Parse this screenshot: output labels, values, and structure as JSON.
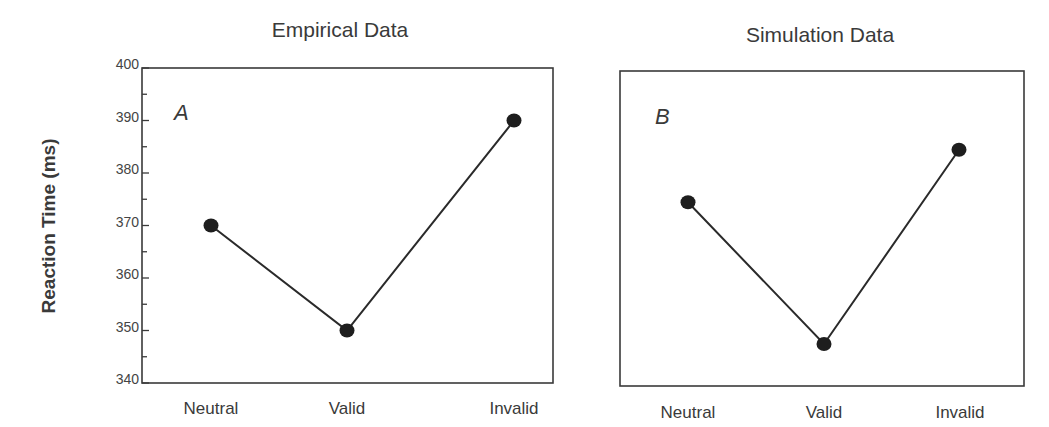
{
  "chart_data": [
    {
      "type": "line",
      "title": "Empirical Data",
      "panel_label": "A",
      "xlabel": "",
      "ylabel": "Reaction Time (ms)",
      "categories": [
        "Neutral",
        "Valid",
        "Invalid"
      ],
      "values": [
        370,
        350,
        390
      ],
      "ylim": [
        340,
        400
      ],
      "yticks": [
        340,
        350,
        360,
        370,
        380,
        390,
        400
      ],
      "grid": false,
      "legend": null,
      "marker": "filled-circle"
    },
    {
      "type": "line",
      "title": "Simulation Data",
      "panel_label": "B",
      "xlabel": "",
      "ylabel": "",
      "categories": [
        "Neutral",
        "Valid",
        "Invalid"
      ],
      "values": [
        375,
        348,
        385
      ],
      "ylim": [
        340,
        400
      ],
      "yticks": [],
      "grid": false,
      "legend": null,
      "marker": "filled-circle"
    }
  ],
  "shared": {
    "ylabel": "Reaction Time (ms)"
  },
  "colors": {
    "line": "#2a2a2a",
    "marker": "#1e1e1e",
    "frame": "#3a3a3a",
    "text": "#3a3a3a"
  }
}
